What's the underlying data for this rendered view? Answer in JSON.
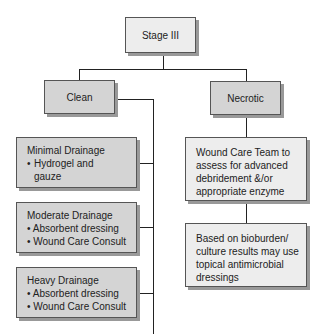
{
  "root": {
    "label": "Stage III"
  },
  "branches": [
    {
      "label": "Clean",
      "children": [
        {
          "title": "Minimal Drainage",
          "bullets": [
            "Hydrogel and gauze"
          ]
        },
        {
          "title": "Moderate Drainage",
          "bullets": [
            "Absorbent dressing",
            "Wound Care Consult"
          ]
        },
        {
          "title": "Heavy Drainage",
          "bullets": [
            "Absorbent dressing",
            "Wound Care Consult"
          ]
        }
      ]
    },
    {
      "label": "Necrotic",
      "children": [
        {
          "text": "Wound Care Team to assess for advanced debridement &/or appropriate enzyme"
        },
        {
          "text": "Based on bioburden/ culture results may use topical antimicrobial dressings"
        }
      ]
    }
  ],
  "bullet": "•"
}
